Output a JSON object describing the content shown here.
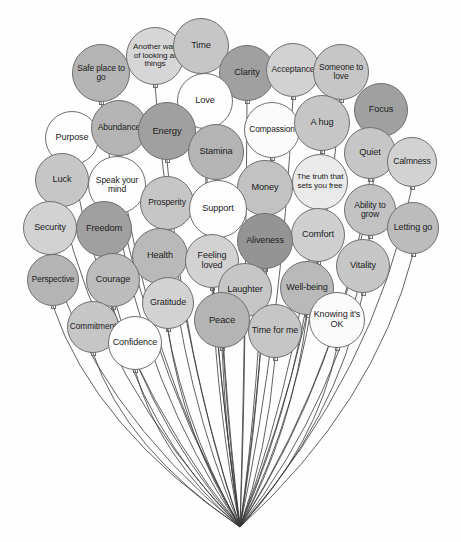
{
  "figure": {
    "kind": "balloon-cluster-diagram",
    "background": "#fefefe",
    "outline_color": "#6f6f6f",
    "string_color": "#3a3a3a",
    "knot_point": {
      "x": 240,
      "y": 527
    },
    "canvas": {
      "width": 461,
      "height": 542
    }
  },
  "palette": {
    "white": "#fdfdfd",
    "very_light": "#f2f2f2",
    "light": "#e3e3e3",
    "light_mid": "#d6d6d6",
    "mid": "#c6c6c6",
    "mid_dark": "#b4b4b4",
    "dark": "#a0a0a0",
    "darkest": "#8e8e8e"
  },
  "balloons": [
    {
      "id": "safe-place-to-go",
      "label": "Safe place to go",
      "cx": 101,
      "cy": 73,
      "r": 29,
      "fill": "#b4b4b4",
      "size": 8.4
    },
    {
      "id": "another-way",
      "label": "Another way of looking at things",
      "cx": 155,
      "cy": 56,
      "r": 29,
      "fill": "#d6d6d6",
      "size": 8.1
    },
    {
      "id": "time",
      "label": "Time",
      "cx": 201,
      "cy": 46,
      "r": 28,
      "fill": "#c6c6c6",
      "size": 9.2
    },
    {
      "id": "clarity",
      "label": "Clarity",
      "cx": 247,
      "cy": 73,
      "r": 28,
      "fill": "#a0a0a0",
      "size": 9.2
    },
    {
      "id": "acceptance",
      "label": "Acceptance",
      "cx": 293,
      "cy": 70,
      "r": 27,
      "fill": "#d2d2d2",
      "size": 8.4
    },
    {
      "id": "someone-to-love",
      "label": "Someone to love",
      "cx": 341,
      "cy": 72,
      "r": 28,
      "fill": "#c6c6c6",
      "size": 8.4
    },
    {
      "id": "love",
      "label": "Love",
      "cx": 205,
      "cy": 101,
      "r": 28,
      "fill": "#fdfdfd",
      "size": 9.2
    },
    {
      "id": "focus",
      "label": "Focus",
      "cx": 381,
      "cy": 110,
      "r": 27,
      "fill": "#a0a0a0",
      "size": 9.2
    },
    {
      "id": "purpose",
      "label": "Purpose",
      "cx": 72,
      "cy": 138,
      "r": 27,
      "fill": "#fdfdfd",
      "size": 9.0
    },
    {
      "id": "abundance",
      "label": "Abundance",
      "cx": 119,
      "cy": 128,
      "r": 28,
      "fill": "#b4b4b4",
      "size": 8.6
    },
    {
      "id": "energy",
      "label": "Energy",
      "cx": 167,
      "cy": 131,
      "r": 29,
      "fill": "#a0a0a0",
      "size": 9.4
    },
    {
      "id": "compassion",
      "label": "Compassion",
      "cx": 272,
      "cy": 130,
      "r": 28,
      "fill": "#fbfbfb",
      "size": 8.4
    },
    {
      "id": "a-hug",
      "label": "A hug",
      "cx": 322,
      "cy": 123,
      "r": 28,
      "fill": "#c6c6c6",
      "size": 9.2
    },
    {
      "id": "stamina",
      "label": "Stamina",
      "cx": 216,
      "cy": 152,
      "r": 28,
      "fill": "#b4b4b4",
      "size": 9.2
    },
    {
      "id": "quiet",
      "label": "Quiet",
      "cx": 370,
      "cy": 153,
      "r": 26,
      "fill": "#c6c6c6",
      "size": 9.2
    },
    {
      "id": "calmness",
      "label": "Calmness",
      "cx": 412,
      "cy": 162,
      "r": 25,
      "fill": "#d2d2d2",
      "size": 8.6
    },
    {
      "id": "luck",
      "label": "Luck",
      "cx": 62,
      "cy": 180,
      "r": 27,
      "fill": "#c6c6c6",
      "size": 9.2
    },
    {
      "id": "speak-your-mind",
      "label": "Speak your mind",
      "cx": 117,
      "cy": 185,
      "r": 29,
      "fill": "#fdfdfd",
      "size": 8.6
    },
    {
      "id": "money",
      "label": "Money",
      "cx": 265,
      "cy": 188,
      "r": 28,
      "fill": "#c2c2c2",
      "size": 9.2
    },
    {
      "id": "the-truth",
      "label": "The truth that sets you free",
      "cx": 320,
      "cy": 182,
      "r": 28,
      "fill": "#eaeaea",
      "size": 8.1
    },
    {
      "id": "prosperity",
      "label": "Prosperity",
      "cx": 167,
      "cy": 203,
      "r": 27,
      "fill": "#c6c6c6",
      "size": 8.6
    },
    {
      "id": "support",
      "label": "Support",
      "cx": 218,
      "cy": 209,
      "r": 29,
      "fill": "#fdfdfd",
      "size": 9.2
    },
    {
      "id": "ability-to-grow",
      "label": "Ability to grow",
      "cx": 370,
      "cy": 210,
      "r": 26,
      "fill": "#c2c2c2",
      "size": 8.6
    },
    {
      "id": "security",
      "label": "Security",
      "cx": 50,
      "cy": 228,
      "r": 27,
      "fill": "#d2d2d2",
      "size": 9.0
    },
    {
      "id": "freedom",
      "label": "Freedom",
      "cx": 104,
      "cy": 229,
      "r": 28,
      "fill": "#a0a0a0",
      "size": 9.2
    },
    {
      "id": "comfort",
      "label": "Comfort",
      "cx": 318,
      "cy": 235,
      "r": 27,
      "fill": "#cfcfcf",
      "size": 9.2
    },
    {
      "id": "letting-go",
      "label": "Letting go",
      "cx": 413,
      "cy": 228,
      "r": 26,
      "fill": "#bcbcbc",
      "size": 9.0
    },
    {
      "id": "health",
      "label": "Health",
      "cx": 160,
      "cy": 256,
      "r": 28,
      "fill": "#b9b9b9",
      "size": 9.2
    },
    {
      "id": "feeling-loved",
      "label": "Feeling loved",
      "cx": 212,
      "cy": 261,
      "r": 27,
      "fill": "#d2d2d2",
      "size": 9.0
    },
    {
      "id": "aliveness",
      "label": "Aliveness",
      "cx": 265,
      "cy": 241,
      "r": 28,
      "fill": "#949494",
      "size": 9.0
    },
    {
      "id": "vitality",
      "label": "Vitality",
      "cx": 363,
      "cy": 266,
      "r": 27,
      "fill": "#c6c6c6",
      "size": 9.2
    },
    {
      "id": "perspective",
      "label": "Perspective",
      "cx": 53,
      "cy": 280,
      "r": 26,
      "fill": "#b4b4b4",
      "size": 8.4
    },
    {
      "id": "courage",
      "label": "Courage",
      "cx": 113,
      "cy": 280,
      "r": 27,
      "fill": "#bcbcbc",
      "size": 9.2
    },
    {
      "id": "laughter",
      "label": "Laughter",
      "cx": 245,
      "cy": 290,
      "r": 27,
      "fill": "#c6c6c6",
      "size": 9.2
    },
    {
      "id": "well-being",
      "label": "Well-being",
      "cx": 307,
      "cy": 288,
      "r": 27,
      "fill": "#b9b9b9",
      "size": 9.0
    },
    {
      "id": "gratitude",
      "label": "Gratitude",
      "cx": 168,
      "cy": 303,
      "r": 26,
      "fill": "#d2d2d2",
      "size": 9.0
    },
    {
      "id": "commitment",
      "label": "Commitment",
      "cx": 93,
      "cy": 327,
      "r": 26,
      "fill": "#c6c6c6",
      "size": 8.4
    },
    {
      "id": "peace",
      "label": "Peace",
      "cx": 222,
      "cy": 320,
      "r": 28,
      "fill": "#b4b4b4",
      "size": 9.4
    },
    {
      "id": "time-for-me",
      "label": "Time for me",
      "cx": 275,
      "cy": 331,
      "r": 27,
      "fill": "#c6c6c6",
      "size": 9.0
    },
    {
      "id": "knowing-its-ok",
      "label": "Knowing it's OK",
      "cx": 337,
      "cy": 320,
      "r": 28,
      "fill": "#fbfbfb",
      "size": 9.0
    },
    {
      "id": "confidence",
      "label": "Confidence",
      "cx": 135,
      "cy": 343,
      "r": 27,
      "fill": "#fdfdfd",
      "size": 9.0
    }
  ]
}
